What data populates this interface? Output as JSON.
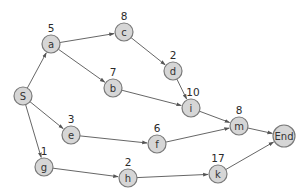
{
  "diagram": {
    "type": "directed-graph",
    "nodes": [
      {
        "id": "S",
        "label": "S",
        "weight": "",
        "x": 23,
        "y": 96
      },
      {
        "id": "a",
        "label": "a",
        "weight": "5",
        "x": 51,
        "y": 44
      },
      {
        "id": "c",
        "label": "c",
        "weight": "8",
        "x": 124,
        "y": 32
      },
      {
        "id": "b",
        "label": "b",
        "weight": "7",
        "x": 113,
        "y": 88
      },
      {
        "id": "d",
        "label": "d",
        "weight": "2",
        "x": 173,
        "y": 71
      },
      {
        "id": "i",
        "label": "i",
        "weight": "10",
        "x": 191,
        "y": 108
      },
      {
        "id": "e",
        "label": "e",
        "weight": "3",
        "x": 71,
        "y": 135
      },
      {
        "id": "f",
        "label": "f",
        "weight": "6",
        "x": 157,
        "y": 144
      },
      {
        "id": "m",
        "label": "m",
        "weight": "8",
        "x": 239,
        "y": 126
      },
      {
        "id": "End",
        "label": "End",
        "weight": "",
        "x": 284,
        "y": 136
      },
      {
        "id": "g",
        "label": "g",
        "weight": "1",
        "x": 44,
        "y": 167
      },
      {
        "id": "h",
        "label": "h",
        "weight": "2",
        "x": 128,
        "y": 178
      },
      {
        "id": "k",
        "label": "k",
        "weight": "17",
        "x": 218,
        "y": 174
      }
    ],
    "edges": [
      {
        "from": "S",
        "to": "a"
      },
      {
        "from": "S",
        "to": "e"
      },
      {
        "from": "S",
        "to": "g"
      },
      {
        "from": "a",
        "to": "c"
      },
      {
        "from": "a",
        "to": "b"
      },
      {
        "from": "c",
        "to": "d"
      },
      {
        "from": "d",
        "to": "i"
      },
      {
        "from": "b",
        "to": "i"
      },
      {
        "from": "i",
        "to": "m"
      },
      {
        "from": "e",
        "to": "f"
      },
      {
        "from": "f",
        "to": "m"
      },
      {
        "from": "m",
        "to": "End"
      },
      {
        "from": "g",
        "to": "h"
      },
      {
        "from": "h",
        "to": "k"
      },
      {
        "from": "k",
        "to": "End"
      }
    ],
    "colors": {
      "node_fill": "#d6d6d6",
      "node_stroke": "#7a7a7a",
      "edge": "#555555",
      "text": "#2a2a2a"
    }
  }
}
